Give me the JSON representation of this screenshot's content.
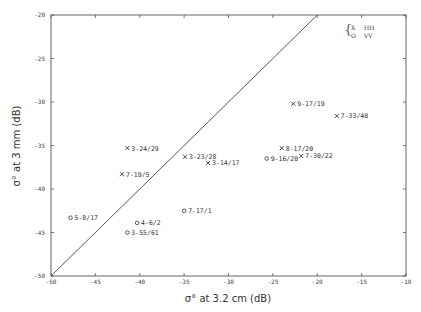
{
  "chart_data": {
    "type": "scatter",
    "title": "",
    "xlabel": "σ° at 3.2 cm (dB)",
    "ylabel": "σ° at 3 mm (dB)",
    "xlim": [
      -50,
      -10
    ],
    "ylim": [
      -50,
      -20
    ],
    "x_ticks": [
      -50,
      -45,
      -40,
      -35,
      -30,
      -25,
      -20,
      -15,
      -10
    ],
    "y_ticks": [
      -20,
      -25,
      -30,
      -35,
      -40,
      -45,
      -50
    ],
    "x_tick_labels": [
      "-50",
      "-45",
      "-40",
      "-35",
      "-30",
      "-25",
      "-20",
      "-15",
      "-10"
    ],
    "y_tick_labels": [
      "-20",
      "-25",
      "-30",
      "-35",
      "-40",
      "-45",
      "-50"
    ],
    "grid": false,
    "reference_line": {
      "label": "1:1 line",
      "from": [
        -50,
        -50
      ],
      "to": [
        -20,
        -20
      ]
    },
    "legend": {
      "position": "top-right",
      "entries": [
        {
          "marker": "X",
          "label": "HH"
        },
        {
          "marker": "O",
          "label": "VV"
        }
      ]
    },
    "series": [
      {
        "name": "HH",
        "marker": "x",
        "points": [
          {
            "label": "9-17/19",
            "x": -22.7,
            "y": -30.2
          },
          {
            "label": "7-33/40",
            "x": -17.8,
            "y": -31.6
          },
          {
            "label": "8-17/20",
            "x": -24.0,
            "y": -35.3
          },
          {
            "label": "7-30/22",
            "x": -21.8,
            "y": -36.2
          },
          {
            "label": "3-24/29",
            "x": -41.4,
            "y": -35.3
          },
          {
            "label": "3-23/28",
            "x": -34.9,
            "y": -36.3
          },
          {
            "label": "3-14/17",
            "x": -32.3,
            "y": -37.0
          },
          {
            "label": "7-19/5",
            "x": -42.0,
            "y": -38.3
          }
        ]
      },
      {
        "name": "VV",
        "marker": "o",
        "points": [
          {
            "label": "9-16/20",
            "x": -25.7,
            "y": -36.5
          },
          {
            "label": "7-17/1",
            "x": -35.0,
            "y": -42.5
          },
          {
            "label": "5-8/17",
            "x": -47.8,
            "y": -43.3
          },
          {
            "label": "4-6/2",
            "x": -40.3,
            "y": -43.9
          },
          {
            "label": "3-55/61",
            "x": -41.4,
            "y": -45.0
          }
        ]
      }
    ]
  },
  "axes": {
    "x_title": "σ° at 3.2 cm (dB)",
    "y_title": "σ° at 3 mm (dB)"
  },
  "legend": {
    "brace": "{",
    "hh_marker": "X",
    "hh_label": "HH",
    "vv_marker": "O",
    "vv_label": "VV"
  }
}
